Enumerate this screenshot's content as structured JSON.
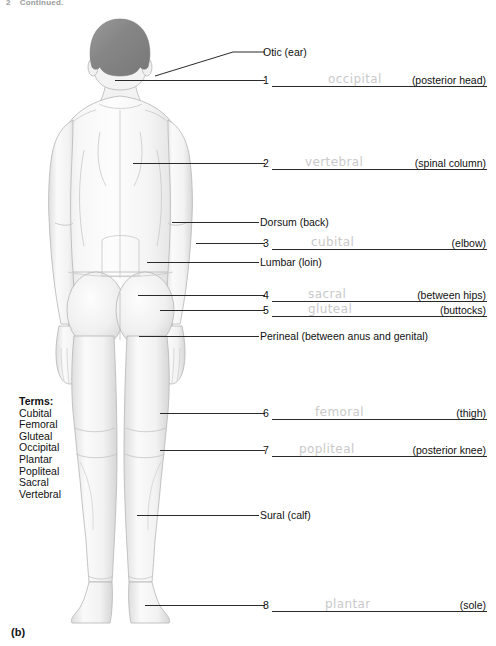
{
  "header": {
    "figure_number": "2",
    "continued_text": "Continued."
  },
  "caption": "(b)",
  "terms": {
    "title": "Terms:",
    "items": [
      "Cubital",
      "Femoral",
      "Gluteal",
      "Occipital",
      "Plantar",
      "Popliteal",
      "Sacral",
      "Vertebral"
    ]
  },
  "plain_labels": [
    {
      "id": "otic",
      "text": "Otic (ear)"
    },
    {
      "id": "dorsum",
      "text": "Dorsum (back)"
    },
    {
      "id": "lumbar",
      "text": "Lumbar (loin)"
    },
    {
      "id": "perineal",
      "text": "Perineal (between anus and genital)"
    },
    {
      "id": "sural",
      "text": "Sural (calf)"
    }
  ],
  "answers": [
    {
      "number": "1",
      "written": "occipital",
      "hint": "(posterior head)"
    },
    {
      "number": "2",
      "written": "vertebral",
      "hint": "(spinal column)"
    },
    {
      "number": "3",
      "written": "cubital",
      "hint": "(elbow)"
    },
    {
      "number": "4",
      "written": "sacral",
      "hint": "(between hips)"
    },
    {
      "number": "5",
      "written": "gluteal",
      "hint": "(buttocks)"
    },
    {
      "number": "6",
      "written": "femoral",
      "hint": "(thigh)"
    },
    {
      "number": "7",
      "written": "popliteal",
      "hint": "(posterior knee)"
    },
    {
      "number": "8",
      "written": "plantar",
      "hint": "(sole)"
    }
  ],
  "colors": {
    "hair": "#8a8a8a",
    "skin_light": "#fbfbfb",
    "skin_shade": "#d8d8d8",
    "outline": "#b0b0b0",
    "leader_line": "#2a2a2a",
    "pencil": "#c9c9c9"
  },
  "figure": {
    "view": "posterior human body",
    "alt": "Grayscale posterior view illustration of a standing human figure"
  }
}
